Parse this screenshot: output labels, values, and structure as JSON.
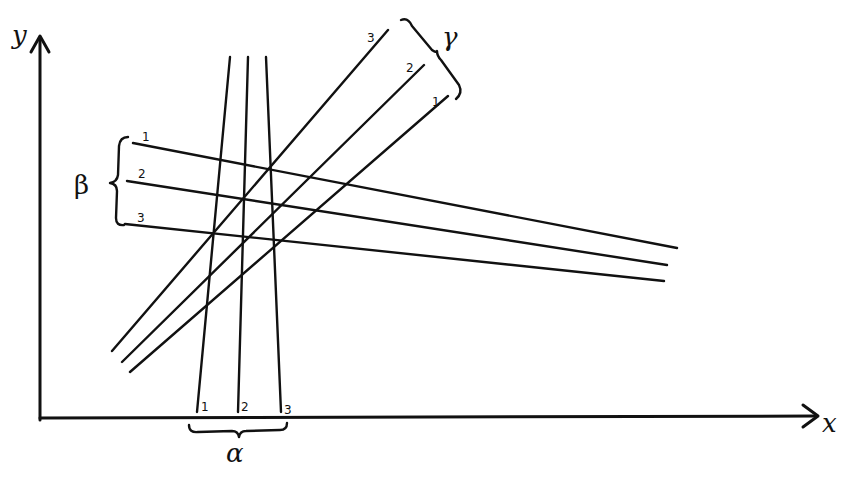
{
  "diagram": {
    "type": "hand-drawn line families on x-y axes",
    "colors": {
      "ink": "#111111",
      "background": "#ffffff"
    },
    "axes": {
      "x_label": "x",
      "y_label": "y"
    },
    "families": [
      {
        "name": "alpha",
        "symbol": "α",
        "orientation": "near-vertical, fanning slightly",
        "lines": [
          {
            "label": "1",
            "x1": 230,
            "y1": 57,
            "x2": 197,
            "y2": 412
          },
          {
            "label": "2",
            "x1": 248,
            "y1": 57,
            "x2": 238,
            "y2": 412
          },
          {
            "label": "3",
            "x1": 266,
            "y1": 57,
            "x2": 281,
            "y2": 412
          }
        ]
      },
      {
        "name": "beta",
        "symbol": "β",
        "orientation": "shallow descending to the right",
        "lines": [
          {
            "label": "1",
            "x1": 133,
            "y1": 143,
            "x2": 677,
            "y2": 248
          },
          {
            "label": "2",
            "x1": 127,
            "y1": 181,
            "x2": 667,
            "y2": 265
          },
          {
            "label": "3",
            "x1": 125,
            "y1": 224,
            "x2": 664,
            "y2": 281
          }
        ]
      },
      {
        "name": "gamma",
        "symbol": "γ",
        "orientation": "rising diagonal",
        "lines": [
          {
            "label": "3",
            "x1": 388,
            "y1": 30,
            "x2": 112,
            "y2": 351
          },
          {
            "label": "2",
            "x1": 424,
            "y1": 65,
            "x2": 122,
            "y2": 362
          },
          {
            "label": "1",
            "x1": 448,
            "y1": 96,
            "x2": 130,
            "y2": 372
          }
        ]
      }
    ]
  }
}
